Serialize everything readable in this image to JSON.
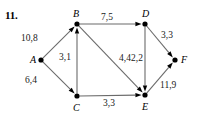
{
  "problem": {
    "number": "11."
  },
  "graph": {
    "nodes": [
      {
        "id": "A",
        "label": "A",
        "x": 41,
        "y": 60,
        "label_x": 30,
        "label_y": 54
      },
      {
        "id": "B",
        "label": "B",
        "x": 77,
        "y": 24,
        "label_x": 73,
        "label_y": 8
      },
      {
        "id": "C",
        "label": "C",
        "x": 77,
        "y": 96,
        "label_x": 73,
        "label_y": 102
      },
      {
        "id": "D",
        "label": "D",
        "x": 145,
        "y": 24,
        "label_x": 142,
        "label_y": 8
      },
      {
        "id": "E",
        "label": "E",
        "x": 145,
        "y": 95,
        "label_x": 142,
        "label_y": 101
      },
      {
        "id": "F",
        "label": "F",
        "x": 175,
        "y": 60,
        "label_x": 181,
        "label_y": 54
      }
    ],
    "edges": [
      {
        "from": "A",
        "to": "B",
        "weight": "10,8",
        "label_x": 21,
        "label_y": 33
      },
      {
        "from": "A",
        "to": "C",
        "weight": "6,4",
        "label_x": 25,
        "label_y": 75
      },
      {
        "from": "C",
        "to": "B",
        "weight": "3,1",
        "label_x": 59,
        "label_y": 52
      },
      {
        "from": "B",
        "to": "D",
        "weight": "7,5",
        "label_x": 101,
        "label_y": 12
      },
      {
        "from": "B",
        "to": "E",
        "weight": "4,4",
        "label_x": 119,
        "label_y": 53
      },
      {
        "from": "C",
        "to": "E",
        "weight": "3,3",
        "label_x": 103,
        "label_y": 98
      },
      {
        "from": "D",
        "to": "E",
        "weight": "2,2",
        "label_x": 131,
        "label_y": 53
      },
      {
        "from": "D",
        "to": "F",
        "weight": "3,3",
        "label_x": 161,
        "label_y": 30
      },
      {
        "from": "E",
        "to": "F",
        "weight": "11,9",
        "label_x": 160,
        "label_y": 80
      }
    ],
    "colors": {
      "edge": "#6b6b6b",
      "node": "#000000",
      "arrow": "#000000",
      "text": "#000000",
      "background": "#ffffff"
    }
  }
}
